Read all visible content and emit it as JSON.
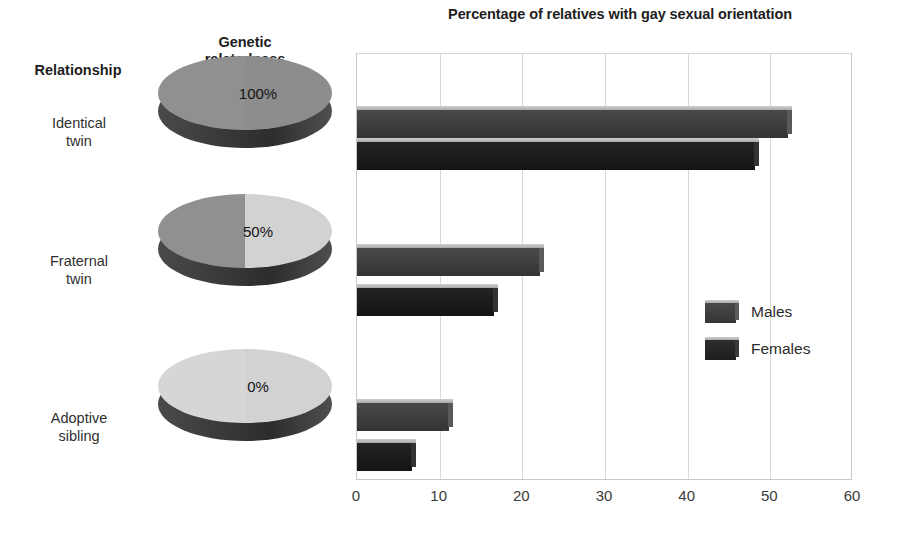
{
  "chart_data": {
    "type": "bar",
    "orientation": "horizontal",
    "title": "Percentage of relatives with gay sexual orientation",
    "xlabel": "",
    "ylabel": "",
    "xlim": [
      0,
      60
    ],
    "xticks": [
      "0",
      "10",
      "20",
      "30",
      "40",
      "50",
      "60"
    ],
    "grid": true,
    "legend_position": "center-right",
    "categories": [
      "Identical twin",
      "Fraternal twin",
      "Adoptive sibling"
    ],
    "series": [
      {
        "name": "Males",
        "values": [
          52,
          22,
          11
        ]
      },
      {
        "name": "Females",
        "values": [
          48,
          16.5,
          6.5
        ]
      }
    ],
    "colors": {
      "males": "#3d3d3d",
      "females": "#1c1c1c"
    }
  },
  "left_panel": {
    "header_relationship": "Relationship",
    "header_genetic_line1": "Genetic",
    "header_genetic_line2": "relatedness",
    "rows": [
      {
        "label_line1": "Identical",
        "label_line2": "twin",
        "percent_label": "100%",
        "relatedness": 100,
        "left_half_color": "#8d8d8d",
        "right_half_color": "#8d8d8d"
      },
      {
        "label_line1": "Fraternal",
        "label_line2": "twin",
        "percent_label": "50%",
        "relatedness": 50,
        "left_half_color": "#8d8d8d",
        "right_half_color": "#d2d2d2"
      },
      {
        "label_line1": "Adoptive",
        "label_line2": "sibling",
        "percent_label": "0%",
        "relatedness": 0,
        "left_half_color": "#d2d2d2",
        "right_half_color": "#d2d2d2"
      }
    ]
  },
  "legend": {
    "items": [
      {
        "label": "Males",
        "color": "#3d3d3d"
      },
      {
        "label": "Females",
        "color": "#1c1c1c"
      }
    ]
  }
}
